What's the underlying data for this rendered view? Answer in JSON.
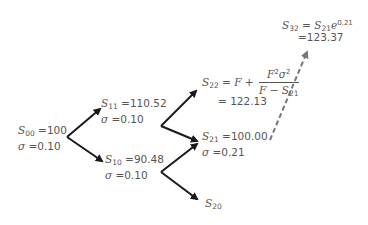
{
  "colors": {
    "arrow": "#1a1a1a",
    "dashed_arrow": "#777777",
    "text": "#555555"
  },
  "nodes": {
    "s00": {
      "symbol": "S",
      "sub": "00",
      "value": " =100",
      "sigma_label": "σ",
      "sigma_value": " =0.10"
    },
    "s11": {
      "symbol": "S",
      "sub": "11",
      "value": " =110.52",
      "sigma_label": "σ",
      "sigma_value": " =0.10"
    },
    "s10": {
      "symbol": "S",
      "sub": "10",
      "value": " =90.48",
      "sigma_label": "σ",
      "sigma_value": " =0.10"
    },
    "s22": {
      "symbol": "S",
      "sub": "22",
      "eq": " = ",
      "F": "F",
      "plus": " + ",
      "num_F": "F",
      "num_F_exp": "2",
      "num_sigma": "σ",
      "num_sigma_exp": "2",
      "den_F": "F",
      "den_minus": " − ",
      "den_S": "S",
      "den_S_sub": "21",
      "value": "= 122.13"
    },
    "s21": {
      "symbol": "S",
      "sub": "21",
      "value": " =100.00",
      "sigma_label": "σ",
      "sigma_value": " =0.21"
    },
    "s20": {
      "symbol": "S",
      "sub": "20"
    },
    "s32": {
      "symbol": "S",
      "sub": "32",
      "eq": " = ",
      "rhs_symbol": "S",
      "rhs_sub": "21",
      "base": "e",
      "exp": "0.21",
      "value": "=123.37"
    }
  }
}
